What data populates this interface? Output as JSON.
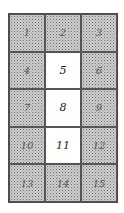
{
  "diagram": {
    "type": "grid",
    "rows": 5,
    "columns": 3,
    "cells": [
      {
        "label": "1",
        "shaded": true
      },
      {
        "label": "2",
        "shaded": true
      },
      {
        "label": "3",
        "shaded": true
      },
      {
        "label": "4",
        "shaded": true
      },
      {
        "label": "5",
        "shaded": false
      },
      {
        "label": "6",
        "shaded": true
      },
      {
        "label": "7",
        "shaded": true
      },
      {
        "label": "8",
        "shaded": false
      },
      {
        "label": "9",
        "shaded": true
      },
      {
        "label": "10",
        "shaded": true
      },
      {
        "label": "11",
        "shaded": false
      },
      {
        "label": "12",
        "shaded": true
      },
      {
        "label": "13",
        "shaded": true
      },
      {
        "label": "14",
        "shaded": true
      },
      {
        "label": "15",
        "shaded": true
      }
    ],
    "colors": {
      "shaded": "#cfcfcf",
      "unshaded": "#ffffff",
      "border": "#4a4a4a"
    }
  }
}
